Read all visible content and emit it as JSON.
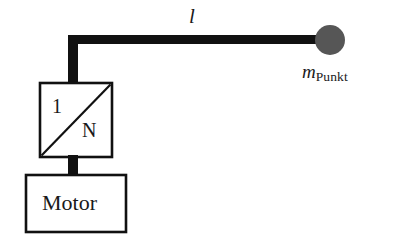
{
  "diagram": {
    "background_color": "#ffffff",
    "stroke_color": "#111111",
    "mass_fill_color": "#565656",
    "labels": {
      "arm_length": "l",
      "mass_symbol": "m",
      "mass_subscript": "Punkt",
      "gearbox_input": "1",
      "gearbox_output": "N",
      "motor": "Motor"
    },
    "parts": {
      "arm": "horizontal-arm",
      "shaft_upper": "vertical-output-shaft",
      "shaft_lower": "motor-gearbox-shaft",
      "gearbox": "gearbox-block",
      "motor": "motor-block",
      "point_mass": "point-mass-circle"
    },
    "geometry": {
      "arm": {
        "x": 68,
        "y": 35,
        "width": 258,
        "height": 9
      },
      "shaft_upper": {
        "x": 68,
        "y": 35,
        "width": 10,
        "height": 49
      },
      "shaft_lower": {
        "x": 68,
        "y": 156,
        "width": 10,
        "height": 20
      },
      "gearbox": {
        "x": 40,
        "y": 83,
        "width": 72,
        "height": 74
      },
      "motor": {
        "x": 26,
        "y": 175,
        "width": 100,
        "height": 57
      },
      "point_mass": {
        "cx": 330,
        "cy": 40,
        "r": 15
      }
    }
  }
}
